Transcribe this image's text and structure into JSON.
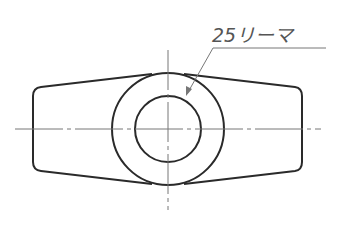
{
  "drawing": {
    "annotation": "25リーマ",
    "colors": {
      "outline": "#2a2a2a",
      "centerline": "#777777",
      "leader": "#777777"
    }
  }
}
